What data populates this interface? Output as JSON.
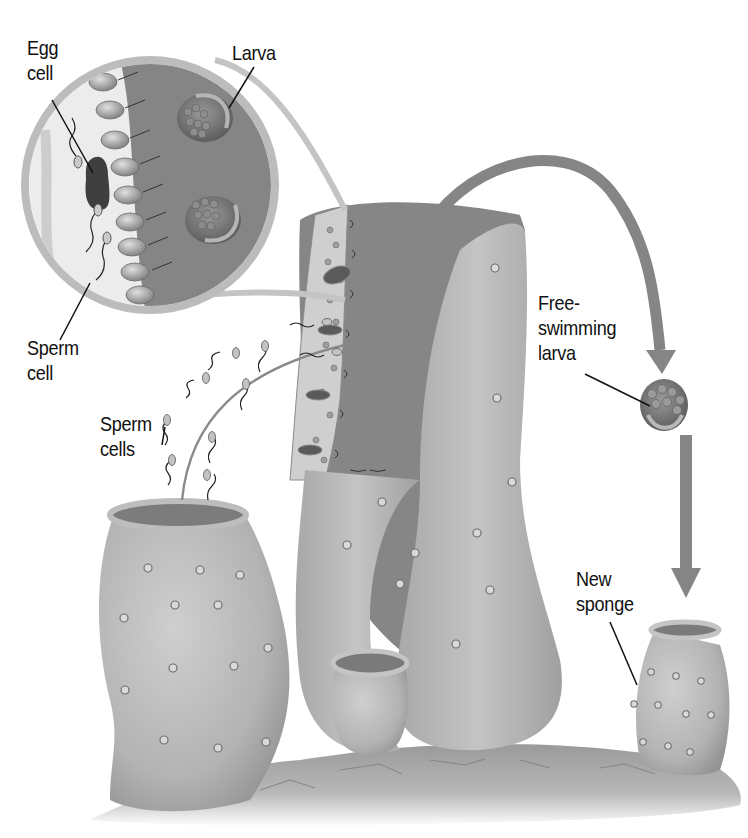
{
  "diagram": {
    "labels": {
      "egg_cell": "Egg\ncell",
      "larva": "Larva",
      "sperm_cell": "Sperm\ncell",
      "sperm_cells": "Sperm\ncells",
      "free_swimming_larva": "Free-\nswimming\nlarva",
      "new_sponge": "New\nsponge"
    },
    "colors": {
      "background": "#ffffff",
      "sponge_body": "#b4b4b4",
      "sponge_shadow": "#8c8c8c",
      "inner_cavity": "#7d7d7d",
      "arrow": "#858585",
      "label_text": "#111111",
      "rock": "#a9a9a9"
    }
  }
}
